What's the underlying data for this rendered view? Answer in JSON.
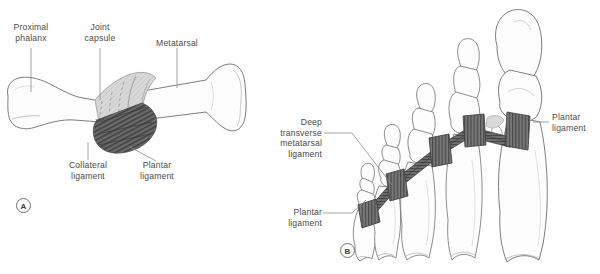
{
  "figure": {
    "background_color": "#ffffff",
    "bone_outline_color": "#6e6e6e",
    "bone_fill_color": "#fdfdfd",
    "capsule_fill_color": "#d6d6d6",
    "ligament_fill_color": "#6a6a6a",
    "ligament_stripe_color": "#3f3f3f",
    "label_text_color": "#4a4a4a",
    "leader_line_color": "#8a8a8a"
  },
  "panel_a": {
    "tag": "A",
    "labels": {
      "proximal_phalanx": "Proximal\nphalanx",
      "joint_capsule": "Joint\ncapsule",
      "metatarsal": "Metatarsal",
      "collateral_ligament": "Collateral\nligament",
      "plantar_ligament": "Plantar\nligament"
    }
  },
  "panel_b": {
    "tag": "B",
    "labels": {
      "deep_transverse_metatarsal_ligament": "Deep\ntransverse\nmetatarsal\nligament",
      "plantar_ligament_left": "Plantar\nligament",
      "plantar_ligament_right": "Plantar\nligament"
    }
  }
}
